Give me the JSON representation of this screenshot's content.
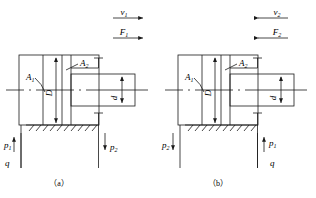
{
  "figure": {
    "kind": "hydraulic-cylinder-schematic",
    "stroke_color": "#1a1a1a",
    "background": "#ffffff"
  },
  "panels": [
    {
      "id": "a",
      "caption": "（a）",
      "motion": {
        "velocity_label": "v",
        "velocity_sub": "1",
        "force_label": "F",
        "force_sub": "1",
        "direction": "right"
      },
      "areas": {
        "piston_area_label": "A",
        "piston_area_sub": "1",
        "annulus_area_label": "A",
        "annulus_area_sub": "2"
      },
      "dimensions": {
        "bore_label": "D",
        "rod_label": "d"
      },
      "ports": {
        "left": {
          "pressure_label": "p",
          "pressure_sub": "1",
          "flow_label": "q",
          "arrow": "up"
        },
        "right": {
          "pressure_label": "p",
          "pressure_sub": "2",
          "flow_label": "",
          "arrow": "down"
        }
      }
    },
    {
      "id": "b",
      "caption": "（b）",
      "motion": {
        "velocity_label": "v",
        "velocity_sub": "2",
        "force_label": "F",
        "force_sub": "2",
        "direction": "left"
      },
      "areas": {
        "piston_area_label": "A",
        "piston_area_sub": "1",
        "annulus_area_label": "A",
        "annulus_area_sub": "2"
      },
      "dimensions": {
        "bore_label": "D",
        "rod_label": "d"
      },
      "ports": {
        "left": {
          "pressure_label": "p",
          "pressure_sub": "2",
          "flow_label": "",
          "arrow": "down"
        },
        "right": {
          "pressure_label": "p",
          "pressure_sub": "1",
          "flow_label": "q",
          "arrow": "up"
        }
      }
    }
  ]
}
